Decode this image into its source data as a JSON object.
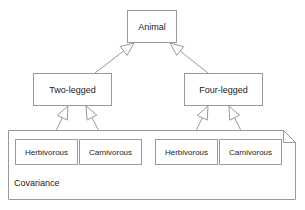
{
  "diagram": {
    "type": "uml-class-diagram",
    "relation": "generalization",
    "colors": {
      "stroke": "#9a9a9a",
      "text": "#1a1a1a",
      "fill": "#ffffff",
      "background": "#ffffff"
    },
    "root": {
      "label": "Animal",
      "x": 127,
      "y": 10,
      "w": 50,
      "h": 33,
      "font_size": 9
    },
    "subclasses": [
      {
        "label": "Two-legged",
        "x": 33,
        "y": 73,
        "w": 79,
        "h": 33,
        "font_size": 9
      },
      {
        "label": "Four-legged",
        "x": 184,
        "y": 73,
        "w": 79,
        "h": 33,
        "font_size": 9
      }
    ],
    "note": {
      "label": "Covariance",
      "x": 8,
      "y": 130,
      "w": 288,
      "h": 70,
      "fold": 12,
      "label_x": 14,
      "label_y": 178,
      "font_size": 9
    },
    "leaves": [
      {
        "label": "Herbivorous",
        "x": 15,
        "y": 139,
        "w": 63,
        "h": 26,
        "font_size": 8,
        "parent": 0
      },
      {
        "label": "Carnivorous",
        "x": 79,
        "y": 139,
        "w": 63,
        "h": 26,
        "font_size": 8,
        "parent": 0
      },
      {
        "label": "Herbivorous",
        "x": 155,
        "y": 139,
        "w": 63,
        "h": 26,
        "font_size": 8,
        "parent": 1
      },
      {
        "label": "Carnivorous",
        "x": 219,
        "y": 139,
        "w": 63,
        "h": 26,
        "font_size": 8,
        "parent": 1
      }
    ],
    "connections": [
      {
        "from": "Two-legged",
        "to": "Animal",
        "arrow_x": 134,
        "arrow_y": 43,
        "tail_x": 95,
        "tail_y": 73
      },
      {
        "from": "Four-legged",
        "to": "Animal",
        "arrow_x": 170,
        "arrow_y": 43,
        "tail_x": 208,
        "tail_y": 73
      },
      {
        "from": "Herbivorous",
        "to": "Two-legged",
        "arrow_x": 68,
        "arrow_y": 106,
        "tail_x": 52,
        "tail_y": 139
      },
      {
        "from": "Carnivorous",
        "to": "Two-legged",
        "arrow_x": 86,
        "arrow_y": 106,
        "tail_x": 103,
        "tail_y": 139
      },
      {
        "from": "Herbivorous",
        "to": "Four-legged",
        "arrow_x": 208,
        "arrow_y": 106,
        "tail_x": 192,
        "tail_y": 139
      },
      {
        "from": "Carnivorous",
        "to": "Four-legged",
        "arrow_x": 229,
        "arrow_y": 106,
        "tail_x": 245,
        "tail_y": 139
      }
    ]
  }
}
